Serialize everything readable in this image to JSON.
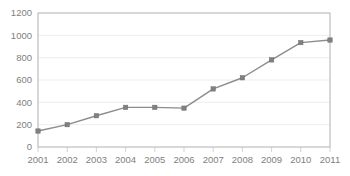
{
  "chart_data": {
    "type": "line",
    "title": "",
    "subtitle": "",
    "xlabel": "",
    "ylabel": "",
    "categories": [
      "2001",
      "2002",
      "2003",
      "2004",
      "2005",
      "2006",
      "2007",
      "2008",
      "2009",
      "2010",
      "2011"
    ],
    "values": [
      143,
      200,
      280,
      355,
      355,
      348,
      520,
      620,
      780,
      935,
      958
    ],
    "series": [
      {
        "name": "Series 1",
        "values": [
          143,
          200,
          280,
          355,
          355,
          348,
          520,
          620,
          780,
          935,
          958
        ]
      }
    ],
    "ylim": [
      0,
      1200
    ],
    "ytick_values": [
      0,
      200,
      400,
      600,
      800,
      1000,
      1200
    ],
    "ytick_labels": [
      "0",
      "200",
      "400",
      "600",
      "800",
      "1000",
      "1200"
    ],
    "xtick_labels": [
      "2001",
      "2002",
      "2003",
      "2004",
      "2005",
      "2006",
      "2007",
      "2008",
      "2009",
      "2010",
      "2011"
    ],
    "grid": true,
    "grid_axis": "y",
    "legend": false,
    "legend_position": "none",
    "marker": "square",
    "annotations": []
  },
  "style": {
    "line_color": "#8c8c8c",
    "marker_color": "#808080",
    "grid_color": "#e8e8e8",
    "axis_color": "#b0b0b0",
    "text_color": "#808080",
    "background": "#ffffff"
  },
  "plot": {
    "left": 38,
    "right": 330,
    "top": 13,
    "bottom": 147
  }
}
